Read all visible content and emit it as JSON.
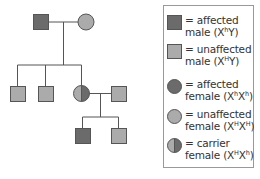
{
  "colors": {
    "affected": "#6b6b6b",
    "unaffected": "#ababab",
    "stroke": "#555555",
    "line": "#555555",
    "text": "#333333"
  },
  "pedigree": {
    "generation_1": [
      {
        "id": "g1-father",
        "sex": "male",
        "status": "affected"
      },
      {
        "id": "g1-mother",
        "sex": "female",
        "status": "unaffected"
      }
    ],
    "generation_2": [
      {
        "id": "g2-son-1",
        "sex": "male",
        "status": "unaffected"
      },
      {
        "id": "g2-son-2",
        "sex": "male",
        "status": "unaffected"
      },
      {
        "id": "g2-daughter",
        "sex": "female",
        "status": "carrier"
      },
      {
        "id": "g2-spouse",
        "sex": "male",
        "status": "unaffected"
      }
    ],
    "generation_3": [
      {
        "id": "g3-son-1",
        "sex": "male",
        "status": "affected"
      },
      {
        "id": "g3-son-2",
        "sex": "male",
        "status": "unaffected"
      }
    ]
  },
  "legend": {
    "items": [
      {
        "symbol": "square",
        "status": "affected",
        "line1": "= affected",
        "line2_prefix": "male (X",
        "sup1": "h",
        "line2_mid": "Y)",
        "sup2": "",
        "line2_suffix": ""
      },
      {
        "symbol": "square",
        "status": "unaffected",
        "line1": "= unaffected",
        "line2_prefix": "male (X",
        "sup1": "H",
        "line2_mid": "Y)",
        "sup2": "",
        "line2_suffix": ""
      },
      {
        "symbol": "circle",
        "status": "affected",
        "line1": "= affected",
        "line2_prefix": "female (X",
        "sup1": "h",
        "line2_mid": "X",
        "sup2": "h",
        "line2_suffix": ")"
      },
      {
        "symbol": "circle",
        "status": "unaffected",
        "line1": "= unaffected",
        "line2_prefix": "female (X",
        "sup1": "H",
        "line2_mid": "X",
        "sup2": "H",
        "line2_suffix": ")"
      },
      {
        "symbol": "circle",
        "status": "carrier",
        "line1": "= carrier",
        "line2_prefix": "female (X",
        "sup1": "H",
        "line2_mid": "X",
        "sup2": "h",
        "line2_suffix": ")"
      }
    ]
  }
}
